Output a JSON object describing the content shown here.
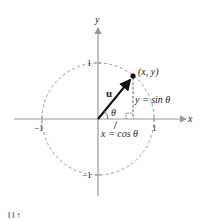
{
  "diagram": {
    "axes": {
      "x_label": "x",
      "y_label": "y"
    },
    "ticks": {
      "x_pos": "1",
      "x_neg": "−1",
      "y_pos": "1",
      "y_neg": "−1"
    },
    "vector_label": "u",
    "angle_label": "θ",
    "point_label": "(x, y)",
    "vertical_label": "y = sin θ",
    "horizontal_label": "x = cos θ",
    "footer_fragment": "‖ ‖   ↑",
    "colors": {
      "axis": "#999999",
      "circle": "#999999",
      "vector": "#111111",
      "text": "#222222"
    }
  }
}
